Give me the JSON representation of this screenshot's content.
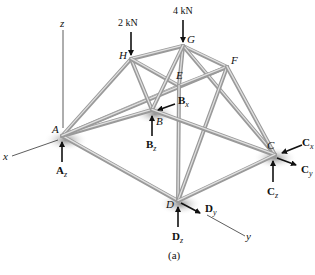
{
  "figure": {
    "caption": "(a)",
    "colors": {
      "member": "#9a9a9a",
      "member_highlight": "#e0e0e0",
      "arrow": "#111111",
      "shadow": "#888888"
    }
  },
  "axes": {
    "x": "x",
    "y": "y",
    "z": "z"
  },
  "nodes": {
    "A": {
      "label": "A",
      "x": 62,
      "y": 136
    },
    "B": {
      "label": "B",
      "x": 152,
      "y": 110
    },
    "C": {
      "label": "C",
      "x": 275,
      "y": 155
    },
    "D": {
      "label": "D",
      "x": 178,
      "y": 201
    },
    "E": {
      "label": "E",
      "x": 179,
      "y": 86
    },
    "F": {
      "label": "F",
      "x": 227,
      "y": 67
    },
    "G": {
      "label": "G",
      "x": 183,
      "y": 46
    },
    "H": {
      "label": "H",
      "x": 131,
      "y": 59
    }
  },
  "members": [
    [
      "A",
      "H"
    ],
    [
      "A",
      "E"
    ],
    [
      "A",
      "B"
    ],
    [
      "A",
      "D"
    ],
    [
      "A",
      "F"
    ],
    [
      "H",
      "G"
    ],
    [
      "H",
      "B"
    ],
    [
      "H",
      "E"
    ],
    [
      "G",
      "E"
    ],
    [
      "G",
      "F"
    ],
    [
      "G",
      "C"
    ],
    [
      "G",
      "B"
    ],
    [
      "E",
      "F"
    ],
    [
      "E",
      "D"
    ],
    [
      "F",
      "D"
    ],
    [
      "F",
      "C"
    ],
    [
      "B",
      "C"
    ],
    [
      "D",
      "C"
    ]
  ],
  "loads": {
    "H": {
      "label": "2 kN"
    },
    "G": {
      "label": "4 kN"
    }
  },
  "reactions": {
    "Az": {
      "main": "A",
      "sub": "z"
    },
    "Bx": {
      "main": "B",
      "sub": "x"
    },
    "Bz": {
      "main": "B",
      "sub": "z"
    },
    "Cx": {
      "main": "C",
      "sub": "x"
    },
    "Cy": {
      "main": "C",
      "sub": "y"
    },
    "Cz": {
      "main": "C",
      "sub": "z"
    },
    "Dy": {
      "main": "D",
      "sub": "y"
    },
    "Dz": {
      "main": "D",
      "sub": "z"
    }
  }
}
